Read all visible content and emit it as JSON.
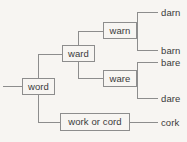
{
  "diagram": {
    "type": "tree",
    "orientation": "left-to-right",
    "root": {
      "id": "word",
      "label": "word",
      "kind": "box"
    },
    "nodes": [
      {
        "id": "word",
        "label": "word",
        "kind": "box",
        "level": 0
      },
      {
        "id": "ward",
        "label": "ward",
        "kind": "box",
        "level": 1
      },
      {
        "id": "work-or-cord",
        "label": "work or cord",
        "kind": "box",
        "level": 1
      },
      {
        "id": "warn",
        "label": "warn",
        "kind": "box",
        "level": 2
      },
      {
        "id": "ware",
        "label": "ware",
        "kind": "box",
        "level": 2
      },
      {
        "id": "darn",
        "label": "darn",
        "kind": "leaf",
        "level": 3
      },
      {
        "id": "barn",
        "label": "barn",
        "kind": "leaf",
        "level": 3
      },
      {
        "id": "bare",
        "label": "bare",
        "kind": "leaf",
        "level": 3
      },
      {
        "id": "dare",
        "label": "dare",
        "kind": "leaf",
        "level": 3
      },
      {
        "id": "cork",
        "label": "cork",
        "kind": "leaf",
        "level": 2
      }
    ],
    "edges": [
      {
        "from": "word",
        "to": "ward"
      },
      {
        "from": "word",
        "to": "work-or-cord"
      },
      {
        "from": "ward",
        "to": "warn"
      },
      {
        "from": "ward",
        "to": "ware"
      },
      {
        "from": "warn",
        "to": "darn"
      },
      {
        "from": "warn",
        "to": "barn"
      },
      {
        "from": "ware",
        "to": "bare"
      },
      {
        "from": "ware",
        "to": "dare"
      },
      {
        "from": "work-or-cord",
        "to": "cork"
      }
    ],
    "labels": {
      "word": "word",
      "ward": "ward",
      "warn": "warn",
      "ware": "ware",
      "work_or_cord": "work or cord",
      "darn": "darn",
      "barn": "barn",
      "bare": "bare",
      "dare": "dare",
      "cork": "cork"
    },
    "colors": {
      "background": "#f7f5f2",
      "line": "#8d8d8d",
      "box_border": "#8d8d8d",
      "box_fill": "#f7f5f2",
      "text": "#3a3a3a"
    }
  }
}
